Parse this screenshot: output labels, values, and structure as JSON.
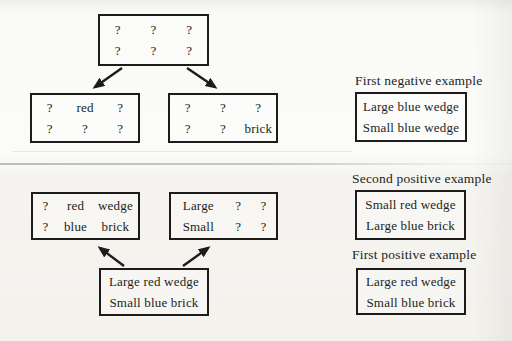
{
  "palette": {
    "ink": "#1d1c1a",
    "paper": "#f7f6f2",
    "scan_line": "#9a9892"
  },
  "diagram": {
    "top_section": {
      "root_box": {
        "rows": [
          [
            "?",
            "?",
            "?"
          ],
          [
            "?",
            "?",
            "?"
          ]
        ]
      },
      "left_generalization_box": {
        "rows": [
          [
            "?",
            "red",
            "?"
          ],
          [
            "?",
            "?",
            "?"
          ]
        ]
      },
      "right_generalization_box": {
        "rows": [
          [
            "?",
            "?",
            "?"
          ],
          [
            "?",
            "?",
            "brick"
          ]
        ]
      }
    },
    "bottom_section": {
      "left_generalization_box": {
        "rows": [
          [
            "?",
            "red",
            "wedge"
          ],
          [
            "?",
            "blue",
            "brick"
          ]
        ]
      },
      "right_generalization_box": {
        "rows": [
          [
            "Large",
            "?",
            "?"
          ],
          [
            "Small",
            "?",
            "?"
          ]
        ]
      },
      "source_box": {
        "lines": [
          "Large red wedge",
          "Small blue brick"
        ]
      }
    }
  },
  "examples": [
    {
      "label": "First negative example",
      "lines": [
        "Large blue wedge",
        "Small blue wedge"
      ]
    },
    {
      "label": "Second positive example",
      "lines": [
        "Small red wedge",
        "Large blue brick"
      ]
    },
    {
      "label": "First positive example",
      "lines": [
        "Large red wedge",
        "Small blue brick"
      ]
    }
  ]
}
